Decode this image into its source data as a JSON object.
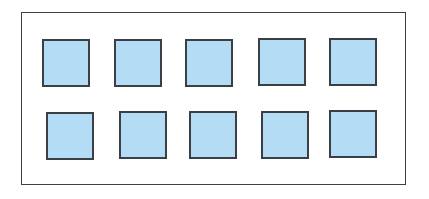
{
  "diagram": {
    "frame": {
      "border_color": "#3c3f43",
      "background": "#ffffff"
    },
    "cell_style": {
      "fill_color": "#b4dcf4",
      "border_color": "#3a3f45"
    },
    "rows": 2,
    "columns": 5,
    "cells": [
      {
        "row": 1,
        "col": 1,
        "x": 42,
        "y": 39
      },
      {
        "row": 1,
        "col": 2,
        "x": 114,
        "y": 39
      },
      {
        "row": 1,
        "col": 3,
        "x": 185,
        "y": 39
      },
      {
        "row": 1,
        "col": 4,
        "x": 258,
        "y": 38
      },
      {
        "row": 1,
        "col": 5,
        "x": 329,
        "y": 38
      },
      {
        "row": 2,
        "col": 1,
        "x": 46,
        "y": 112
      },
      {
        "row": 2,
        "col": 2,
        "x": 119,
        "y": 111
      },
      {
        "row": 2,
        "col": 3,
        "x": 189,
        "y": 111
      },
      {
        "row": 2,
        "col": 4,
        "x": 261,
        "y": 111
      },
      {
        "row": 2,
        "col": 5,
        "x": 329,
        "y": 110
      }
    ]
  }
}
